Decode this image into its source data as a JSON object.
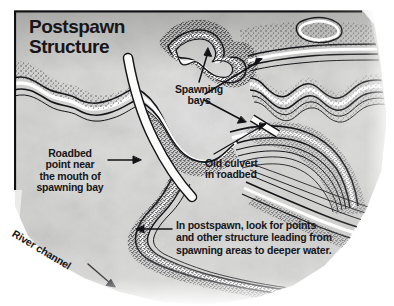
{
  "figure": {
    "title": "Postspawn\nStructure",
    "title_line1": "Postspawn",
    "title_line2": "Structure",
    "type": "hand-drawn lake contour map",
    "border_color": "#101014",
    "ink_color": "#1a1a1e",
    "paper_color": "#d8d8d6",
    "water_color": "#ffffff"
  },
  "labels": {
    "spawning_bays": "Spawning\nbays",
    "old_culvert": "Old culvert\nin roadbed",
    "roadbed_point": "Roadbed\npoint near\nthe mouth of\nspawning bay",
    "postspawn_note": "In postspawn, look for points\nand other structure leading from\nspawning areas to deeper water.",
    "river_channel": "River channel"
  },
  "annotations": [
    {
      "name": "spawning-bays-callout",
      "text": "Spawning bays",
      "arrows": 3
    },
    {
      "name": "old-culvert-callout",
      "text": "Old culvert in roadbed",
      "arrows": 1
    },
    {
      "name": "roadbed-point-callout",
      "text": "Roadbed point near the mouth of spawning bay",
      "arrows": 1
    },
    {
      "name": "postspawn-note-callout",
      "text": "In postspawn, look for points and other structure leading from spawning areas to deeper water.",
      "arrows": 1
    },
    {
      "name": "river-channel-callout",
      "text": "River channel",
      "arrows": 1
    }
  ]
}
